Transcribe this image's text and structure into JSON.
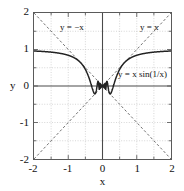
{
  "chart_data": {
    "type": "line",
    "title": "",
    "subtitle": "",
    "xlabel": "x",
    "ylabel": "y",
    "xlim": [
      -2,
      2
    ],
    "ylim": [
      -2,
      2
    ],
    "grid": true,
    "grid_step": 0.5,
    "grid_style": "dotted",
    "legend_position": "inline-annotations",
    "x_ticks": [
      -2,
      -1.5,
      -1,
      -0.5,
      0,
      0.5,
      1,
      1.5,
      2
    ],
    "y_ticks": [
      -2,
      -1.5,
      -1,
      -0.5,
      0,
      0.5,
      1,
      1.5,
      2
    ],
    "x_tick_labels": [
      "-2",
      "",
      "-1",
      "",
      "0",
      "",
      "1",
      "",
      "2"
    ],
    "y_tick_labels": [
      "-2",
      "",
      "-1",
      "",
      "0",
      "",
      "1",
      "",
      "2"
    ],
    "annotations": [
      {
        "text": "y = −x",
        "x": -1.25,
        "y": 1.6
      },
      {
        "text": "y = x",
        "x": 1.05,
        "y": 1.6
      },
      {
        "text": "y = x sin(1/x)",
        "x": 0.42,
        "y": 0.33
      }
    ],
    "series": [
      {
        "name": "y = x sin(1/x)",
        "style": "solid",
        "color": "#222222",
        "width": 1.6,
        "description": "Main curve: x times sine of one over x; approaches 1 as |x| grows, oscillates infinitely near x = 0."
      },
      {
        "name": "y = x",
        "style": "dashed",
        "color": "#555555",
        "width": 0.9,
        "x": [
          -2,
          2
        ],
        "values": [
          -2,
          2
        ]
      },
      {
        "name": "y = −x",
        "style": "dashed",
        "color": "#555555",
        "width": 0.9,
        "x": [
          -2,
          2
        ],
        "values": [
          2,
          -2
        ]
      }
    ],
    "key_points": {
      "value_at_minus_2": 0.958,
      "value_at_minus_1": 0.841,
      "value_at_minus_0_5": -0.455,
      "value_at_0_5": -0.455,
      "value_at_1": 0.841,
      "value_at_2": 0.958,
      "limit_at_infinity": 1,
      "limit_at_zero": 0
    }
  },
  "axis_titles": {
    "x": "x",
    "y": "y"
  },
  "colors": {
    "curve": "#222222",
    "envelope": "#555555",
    "axis": "#4a4a4a",
    "frame": "#5a5a5a",
    "grid": "#b9b9b9",
    "text": "#111111",
    "background": "#ffffff"
  }
}
